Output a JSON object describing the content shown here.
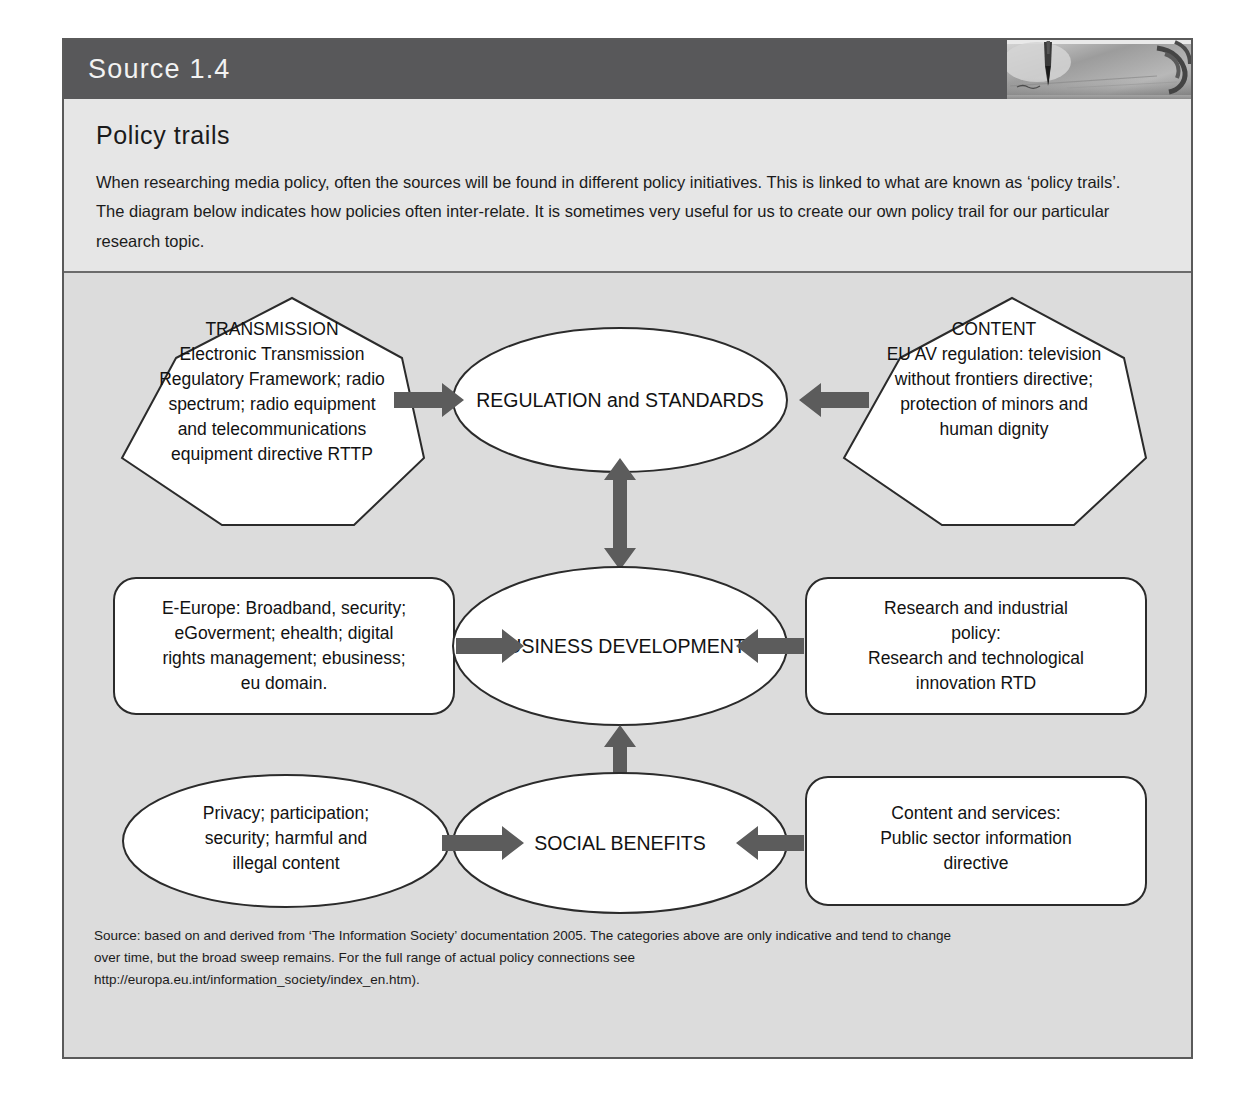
{
  "header": {
    "title": "Source 1.4",
    "photo_alt": "pen-writing-photo",
    "band_color": "#58585a"
  },
  "intro": {
    "title": "Policy trails",
    "body": "When researching media policy, often the sources will be found in different policy initiatives. This is linked to what are known as ‘policy trails’. The diagram below indicates how policies often inter-relate. It is sometimes very useful for us to create our own policy trail for our particular research topic."
  },
  "diagram": {
    "background_color": "#dcdcdc",
    "shape_fill": "#ffffff",
    "shape_stroke": "#2b2b2b",
    "arrow_color": "#5c5c5c",
    "nodes": {
      "transmission": {
        "shape": "heptagon",
        "lines": [
          "TRANSMISSION",
          "Electronic Transmission",
          "Regulatory Framework; radio",
          "spectrum; radio equipment",
          "and telecommunications",
          "equipment directive RTTP"
        ]
      },
      "content": {
        "shape": "heptagon",
        "lines": [
          "CONTENT",
          "EU AV regulation: television",
          "without frontiers directive;",
          "protection of minors and",
          "human dignity"
        ]
      },
      "regulation_and_standards": {
        "shape": "ellipse",
        "lines": [
          "REGULATION and STANDARDS"
        ]
      },
      "e_europe": {
        "shape": "rounded-rect",
        "lines": [
          "E-Europe: Broadband, security;",
          "eGoverment; ehealth; digital",
          "rights management; ebusiness;",
          "eu domain."
        ]
      },
      "research_industrial_policy": {
        "shape": "rounded-rect",
        "lines": [
          "Research and industrial",
          "policy:",
          "Research and technological",
          "innovation RTD"
        ]
      },
      "business_development": {
        "shape": "ellipse",
        "lines": [
          "BUSINESS DEVELOPMENT"
        ]
      },
      "privacy": {
        "shape": "ellipse",
        "lines": [
          "Privacy; participation;",
          "security; harmful and",
          "illegal content"
        ]
      },
      "content_and_services": {
        "shape": "rounded-rect",
        "lines": [
          "Content and services:",
          "Public sector information",
          "directive"
        ]
      },
      "social_benefits": {
        "shape": "ellipse",
        "lines": [
          "SOCIAL BENEFITS"
        ]
      }
    },
    "connectors": [
      {
        "name": "transmission-to-regulation",
        "direction": "right"
      },
      {
        "name": "content-to-regulation",
        "direction": "left"
      },
      {
        "name": "e-europe-to-business",
        "direction": "right"
      },
      {
        "name": "research-to-business",
        "direction": "left"
      },
      {
        "name": "privacy-to-social",
        "direction": "right"
      },
      {
        "name": "content-services-to-social",
        "direction": "left"
      },
      {
        "name": "regulation-to-business",
        "direction": "both-vertical"
      },
      {
        "name": "business-to-social",
        "direction": "both-vertical"
      }
    ]
  },
  "footer": {
    "line1": "Source: based on and derived from ‘The Information Society’ documentation 2005. The categories above are only indicative and tend to change",
    "line2": "over time, but the broad sweep remains. For the full range of actual policy connections see",
    "line3": "http://europa.eu.int/information_society/index_en.htm)."
  }
}
